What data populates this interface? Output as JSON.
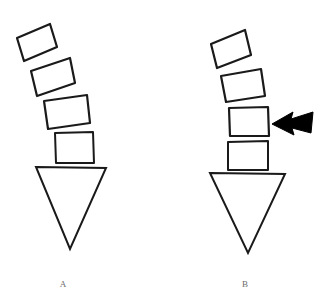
{
  "figure": {
    "background_color": "#ffffff",
    "stroke_color": "#1a1a1a",
    "caption_color": "#6b6b6b",
    "width": 323,
    "height": 308
  },
  "panels": [
    {
      "id": "A",
      "label": "A",
      "label_x": 63,
      "label_y": 285,
      "description": "Curved stack of four vertebral blocks above an inverted triangular sacrum, no annotation arrow",
      "has_arrow": false,
      "blocks": [
        {
          "name": "vertebra-block-1",
          "order": 1,
          "points": "17,38 50,24 57,47 24,61",
          "rotation_deg": -23
        },
        {
          "name": "vertebra-block-2",
          "order": 2,
          "points": "31,71 70,58 75,83 37,96",
          "rotation_deg": -18
        },
        {
          "name": "vertebra-block-3",
          "order": 3,
          "points": "44,101 87,95 90,123 48,129",
          "rotation_deg": -8
        },
        {
          "name": "vertebra-block-4",
          "order": 4,
          "points": "55,133 93,132 94,163 56,163",
          "rotation_deg": -1
        }
      ],
      "sacrum": {
        "name": "sacrum-triangle",
        "points": "36,167 106,168 70,249"
      }
    },
    {
      "id": "B",
      "label": "B",
      "label_x": 245,
      "label_y": 285,
      "description": "Same vertebral stack with a solid black arrow indicating the third block",
      "has_arrow": true,
      "blocks": [
        {
          "name": "vertebra-block-1",
          "order": 1,
          "points": "211,44 245,30 251,55 217,68"
        },
        {
          "name": "vertebra-block-2",
          "order": 2,
          "points": "221,76 261,69 265,96 226,102"
        },
        {
          "name": "vertebra-block-3",
          "order": 3,
          "points": "229,108 268,107 269,136 230,136"
        },
        {
          "name": "vertebra-block-4",
          "order": 4,
          "points": "228,142 268,141 268,170 228,170"
        }
      ],
      "sacrum": {
        "name": "sacrum-triangle",
        "points": "210,173 285,174 248,253"
      },
      "arrow": {
        "name": "annotation-arrow",
        "direction": "left",
        "color": "#000000",
        "target_block": 3,
        "points": "272,124 293,112 291,119 313,112 311,133 292,128 294,135"
      }
    }
  ]
}
